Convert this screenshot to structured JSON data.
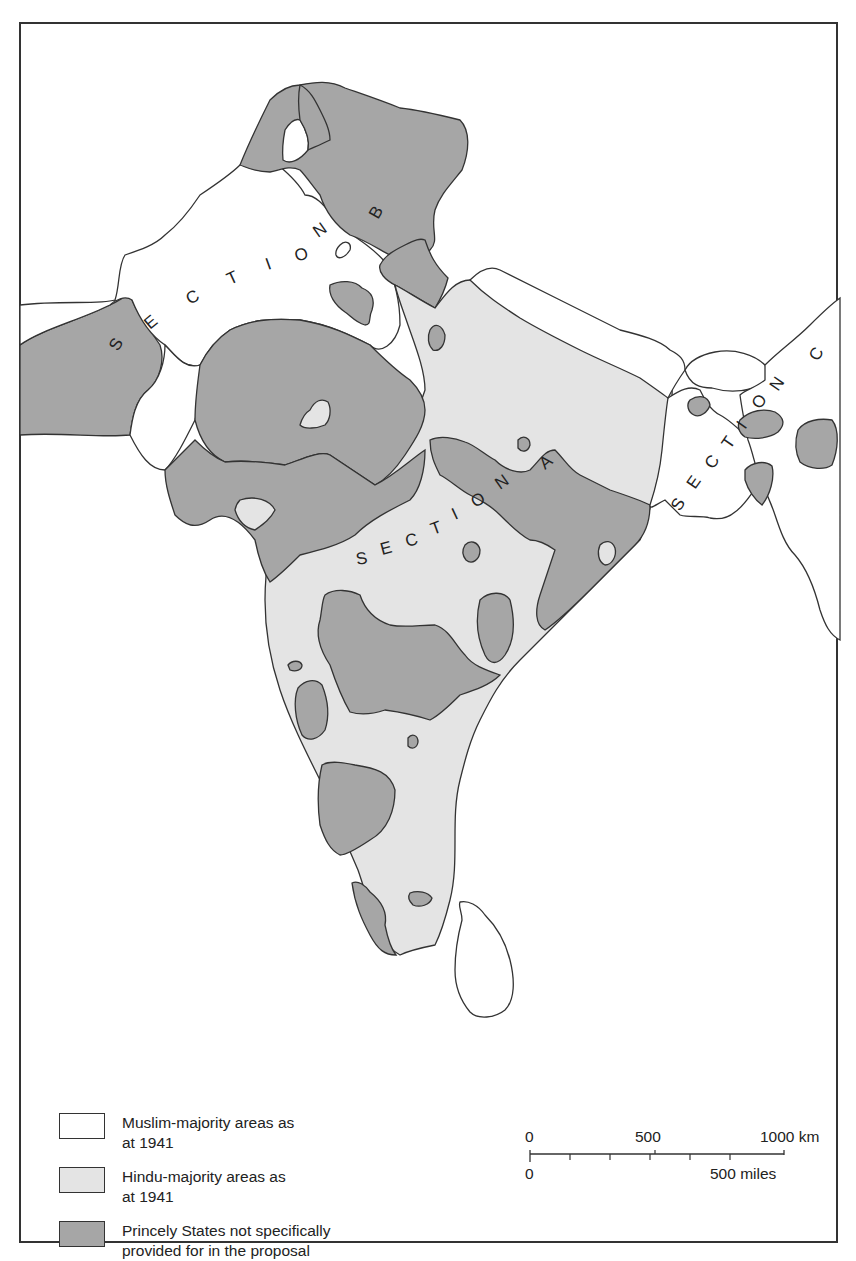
{
  "map": {
    "section_labels": [
      {
        "id": "A",
        "text": "SECTION A"
      },
      {
        "id": "B",
        "text": "SECTION B"
      },
      {
        "id": "C",
        "text": "SECTION C"
      }
    ],
    "colors": {
      "muslim_majority": "#ffffff",
      "hindu_majority": "#e4e4e4",
      "princely_states": "#a6a6a6",
      "outline": "#333333"
    }
  },
  "legend": {
    "items": [
      {
        "label": "Muslim-majority areas as at 1941",
        "line1": "Muslim-majority areas as",
        "line2": "at 1941",
        "color": "#ffffff"
      },
      {
        "label": "Hindu-majority areas as at 1941",
        "line1": "Hindu-majority areas as",
        "line2": "at 1941",
        "color": "#e4e4e4"
      },
      {
        "label": "Princely States not specifically provided for in the proposal",
        "line1": "Princely States not specifically",
        "line2": "provided for in the proposal",
        "color": "#a6a6a6"
      }
    ]
  },
  "scale": {
    "km_labels": [
      "0",
      "500",
      "1000 km"
    ],
    "mile_labels": [
      "0",
      "500 miles"
    ]
  }
}
